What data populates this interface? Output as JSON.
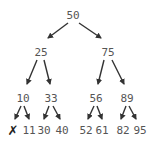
{
  "diagram": {
    "type": "binary-search-tree",
    "colors": {
      "text": "#555555",
      "edge": "#333333",
      "null_mark": "#222222"
    },
    "nodes": [
      {
        "id": "n50",
        "label": "50",
        "x": 73,
        "y": 15
      },
      {
        "id": "n25",
        "label": "25",
        "x": 41,
        "y": 52
      },
      {
        "id": "n75",
        "label": "75",
        "x": 108,
        "y": 52
      },
      {
        "id": "n10",
        "label": "10",
        "x": 23,
        "y": 98
      },
      {
        "id": "n33",
        "label": "33",
        "x": 51,
        "y": 98
      },
      {
        "id": "n56",
        "label": "56",
        "x": 96,
        "y": 98
      },
      {
        "id": "n89",
        "label": "89",
        "x": 127,
        "y": 98
      },
      {
        "id": "n11",
        "label": "11",
        "x": 29,
        "y": 130
      },
      {
        "id": "n30",
        "label": "30",
        "x": 44,
        "y": 130
      },
      {
        "id": "n40",
        "label": "40",
        "x": 62,
        "y": 130
      },
      {
        "id": "n52",
        "label": "52",
        "x": 86,
        "y": 130
      },
      {
        "id": "n61",
        "label": "61",
        "x": 102,
        "y": 130
      },
      {
        "id": "n82",
        "label": "82",
        "x": 123,
        "y": 130
      },
      {
        "id": "n95",
        "label": "95",
        "x": 140,
        "y": 130
      }
    ],
    "null_marks": [
      {
        "id": "null-left-of-10",
        "label": "✗",
        "x": 13,
        "y": 130
      }
    ],
    "edges": [
      {
        "from": "n50",
        "to": "n25",
        "x1": 68,
        "y1": 23,
        "x2": 48,
        "y2": 38
      },
      {
        "from": "n50",
        "to": "n75",
        "x1": 79,
        "y1": 23,
        "x2": 101,
        "y2": 38
      },
      {
        "from": "n25",
        "to": "n10",
        "x1": 37,
        "y1": 60,
        "x2": 27,
        "y2": 84
      },
      {
        "from": "n25",
        "to": "n33",
        "x1": 44,
        "y1": 60,
        "x2": 50,
        "y2": 84
      },
      {
        "from": "n75",
        "to": "n56",
        "x1": 104,
        "y1": 60,
        "x2": 98,
        "y2": 84
      },
      {
        "from": "n75",
        "to": "n89",
        "x1": 112,
        "y1": 60,
        "x2": 124,
        "y2": 84
      },
      {
        "from": "n10",
        "to": "null",
        "x1": 21,
        "y1": 106,
        "x2": 15,
        "y2": 119
      },
      {
        "from": "n10",
        "to": "n11",
        "x1": 24,
        "y1": 106,
        "x2": 29,
        "y2": 119
      },
      {
        "from": "n33",
        "to": "n30",
        "x1": 49,
        "y1": 106,
        "x2": 44,
        "y2": 119
      },
      {
        "from": "n33",
        "to": "n40",
        "x1": 53,
        "y1": 106,
        "x2": 60,
        "y2": 119
      },
      {
        "from": "n56",
        "to": "n52",
        "x1": 94,
        "y1": 106,
        "x2": 88,
        "y2": 119
      },
      {
        "from": "n56",
        "to": "n61",
        "x1": 97,
        "y1": 106,
        "x2": 102,
        "y2": 119
      },
      {
        "from": "n89",
        "to": "n82",
        "x1": 126,
        "y1": 106,
        "x2": 121,
        "y2": 119
      },
      {
        "from": "n89",
        "to": "n95",
        "x1": 129,
        "y1": 106,
        "x2": 136,
        "y2": 119
      }
    ]
  }
}
